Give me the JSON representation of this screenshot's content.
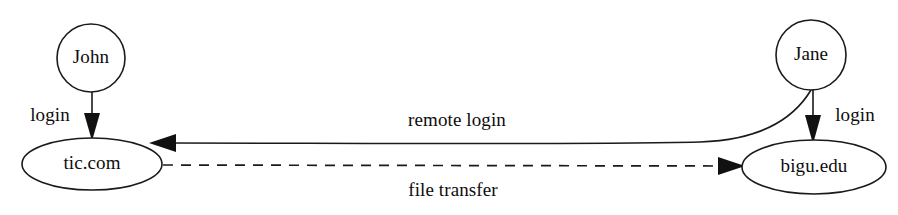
{
  "diagram": {
    "type": "network-node-diagram",
    "canvas": {
      "width": 898,
      "height": 215
    },
    "colors": {
      "background": "#ffffff",
      "stroke": "#1a1a1a",
      "text": "#0d0d0d",
      "arrow_fill": "#111111"
    },
    "nodes": [
      {
        "id": "john",
        "label": "John",
        "shape": "circle",
        "kind": "user",
        "cx": 91,
        "cy": 58,
        "r": 34
      },
      {
        "id": "jane",
        "label": "Jane",
        "shape": "circle",
        "kind": "user",
        "cx": 811,
        "cy": 55,
        "r": 35
      },
      {
        "id": "tic",
        "label": "tic.com",
        "shape": "ellipse",
        "kind": "host",
        "cx": 92,
        "cy": 164,
        "rx": 70,
        "ry": 26
      },
      {
        "id": "bigu",
        "label": "bigu.edu",
        "shape": "ellipse",
        "kind": "host",
        "cx": 814,
        "cy": 167,
        "rx": 72,
        "ry": 27
      }
    ],
    "edges": [
      {
        "id": "john-login",
        "label": "login",
        "from": "john",
        "to": "tic",
        "style": "solid",
        "arrow": "end",
        "label_x": 50,
        "label_y": 117
      },
      {
        "id": "jane-login",
        "label": "login",
        "from": "jane",
        "to": "bigu",
        "style": "solid",
        "arrow": "end",
        "label_x": 855,
        "label_y": 117
      },
      {
        "id": "remote-login",
        "label": "remote login",
        "from": "jane",
        "to": "tic",
        "style": "solid-curved",
        "arrow": "end",
        "label_x": 457,
        "label_y": 122
      },
      {
        "id": "file-transfer",
        "label": "file transfer",
        "from": "tic",
        "to": "bigu",
        "style": "dashed",
        "arrow": "end",
        "label_x": 453,
        "label_y": 192
      }
    ]
  }
}
